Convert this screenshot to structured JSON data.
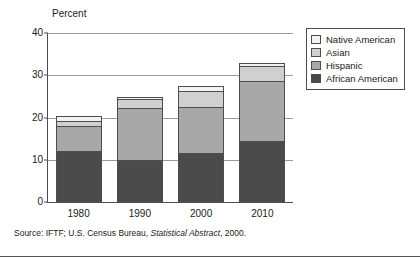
{
  "chart_data": {
    "type": "bar",
    "subtype": "stacked-bar",
    "title": "",
    "xlabel": "",
    "ylabel": "Percent",
    "ylim": [
      0,
      40
    ],
    "yticks": [
      0,
      10,
      20,
      30,
      40
    ],
    "ytick_labels": [
      "0",
      "10",
      "20",
      "30",
      "40"
    ],
    "grid": "horizontal",
    "legend_position": "right",
    "categories": [
      "1980",
      "1990",
      "2000",
      "2010"
    ],
    "series": [
      {
        "name": "African American",
        "color": "#4a4a4a",
        "values": [
          12.0,
          10.0,
          11.7,
          14.5
        ]
      },
      {
        "name": "Hispanic",
        "color": "#a8a8a8",
        "values": [
          6.2,
          12.5,
          11.0,
          14.4
        ]
      },
      {
        "name": "Asian",
        "color": "#d0d0d0",
        "values": [
          1.4,
          2.4,
          4.1,
          3.8
        ]
      },
      {
        "name": "Native American",
        "color": "#f2f2f2",
        "values": [
          1.4,
          0.7,
          1.4,
          1.0
        ]
      }
    ],
    "totals": [
      21.0,
      25.6,
      28.2,
      33.7
    ],
    "legend_order": [
      "Native American",
      "Asian",
      "Hispanic",
      "African American"
    ],
    "source": {
      "prefix": "Source: IFTF; U.S. Census Bureau, ",
      "italic": "Statistical Abstract",
      "suffix": ", 2000."
    }
  },
  "colors": {
    "axis": "#4d4d4d",
    "gridline": "#9a9a9a",
    "background": "#ffffff",
    "text": "#1a1a1a"
  }
}
